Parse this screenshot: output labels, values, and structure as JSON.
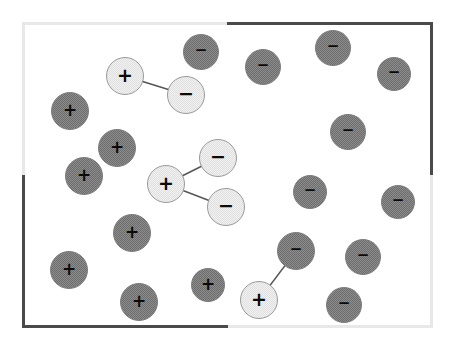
{
  "figure": {
    "width": 455,
    "height": 349,
    "background_color": "#ffffff"
  },
  "vessel": {
    "name": "container-boundary",
    "x": 22,
    "y": 22,
    "width": 411,
    "height": 306,
    "border_color": "#4a4a4a",
    "fill_color": "#ffffff"
  },
  "legend": {
    "plus_symbol": "+",
    "minus_symbol": "−",
    "dark_fill": "#8c8c8c",
    "light_fill": "#f1f1f1",
    "bond_color": "#555555"
  },
  "chart_data": {
    "type": "scatter",
    "xlabel": "",
    "ylabel": "",
    "xlim": [
      22,
      433
    ],
    "ylim": [
      22,
      328
    ],
    "grid": false,
    "legend_position": "none",
    "counts": {
      "positive_ions": 10,
      "negative_ions": 13,
      "bonded_pairs": 2,
      "bonded_triples": 1,
      "total_ions": 23
    },
    "series": [
      {
        "name": "Free positive ions",
        "charge": "+",
        "style": "dark",
        "points": [
          {
            "id": "p1",
            "x": 70,
            "y": 111,
            "r": 19,
            "label": "+"
          },
          {
            "id": "p2",
            "x": 117,
            "y": 148,
            "r": 19,
            "label": "+"
          },
          {
            "id": "p3",
            "x": 84,
            "y": 176,
            "r": 19,
            "label": "+"
          },
          {
            "id": "p4",
            "x": 132,
            "y": 233,
            "r": 19,
            "label": "+"
          },
          {
            "id": "p5",
            "x": 69,
            "y": 270,
            "r": 19,
            "label": "+"
          },
          {
            "id": "p6",
            "x": 139,
            "y": 302,
            "r": 19,
            "label": "+"
          },
          {
            "id": "p7",
            "x": 208,
            "y": 285,
            "r": 17,
            "label": "+"
          }
        ]
      },
      {
        "name": "Free negative ions",
        "charge": "−",
        "style": "dark",
        "points": [
          {
            "id": "n1",
            "x": 201,
            "y": 52,
            "r": 18,
            "label": "−"
          },
          {
            "id": "n2",
            "x": 263,
            "y": 67,
            "r": 18,
            "label": "−"
          },
          {
            "id": "n3",
            "x": 333,
            "y": 48,
            "r": 18,
            "label": "−"
          },
          {
            "id": "n4",
            "x": 394,
            "y": 74,
            "r": 17,
            "label": "−"
          },
          {
            "id": "n5",
            "x": 348,
            "y": 132,
            "r": 18,
            "label": "−"
          },
          {
            "id": "n6",
            "x": 310,
            "y": 192,
            "r": 17,
            "label": "−"
          },
          {
            "id": "n7",
            "x": 398,
            "y": 202,
            "r": 17,
            "label": "−"
          },
          {
            "id": "n8",
            "x": 296,
            "y": 251,
            "r": 19,
            "label": "−"
          },
          {
            "id": "n9",
            "x": 363,
            "y": 257,
            "r": 18,
            "label": "−"
          },
          {
            "id": "n10",
            "x": 344,
            "y": 305,
            "r": 18,
            "label": "−"
          }
        ]
      },
      {
        "name": "Bonded ions",
        "style": "light",
        "points": [
          {
            "id": "b1",
            "x": 125,
            "y": 76,
            "r": 19,
            "label": "+",
            "charge": "+"
          },
          {
            "id": "b2",
            "x": 186,
            "y": 95,
            "r": 19,
            "label": "−",
            "charge": "−"
          },
          {
            "id": "b3",
            "x": 166,
            "y": 184,
            "r": 19,
            "label": "+",
            "charge": "+"
          },
          {
            "id": "b4",
            "x": 218,
            "y": 158,
            "r": 19,
            "label": "−",
            "charge": "−"
          },
          {
            "id": "b5",
            "x": 226,
            "y": 207,
            "r": 19,
            "label": "−",
            "charge": "−"
          },
          {
            "id": "b6",
            "x": 259,
            "y": 300,
            "r": 19,
            "label": "+",
            "charge": "+"
          }
        ]
      }
    ],
    "bonds": [
      {
        "from": "b1",
        "to": "b2",
        "x1": 125,
        "y1": 76,
        "x2": 186,
        "y2": 95
      },
      {
        "from": "b3",
        "to": "b4",
        "x1": 166,
        "y1": 184,
        "x2": 218,
        "y2": 158
      },
      {
        "from": "b3",
        "to": "b5",
        "x1": 166,
        "y1": 184,
        "x2": 226,
        "y2": 207
      },
      {
        "from": "b6",
        "to": "n8",
        "x1": 259,
        "y1": 300,
        "x2": 296,
        "y2": 251
      }
    ]
  }
}
